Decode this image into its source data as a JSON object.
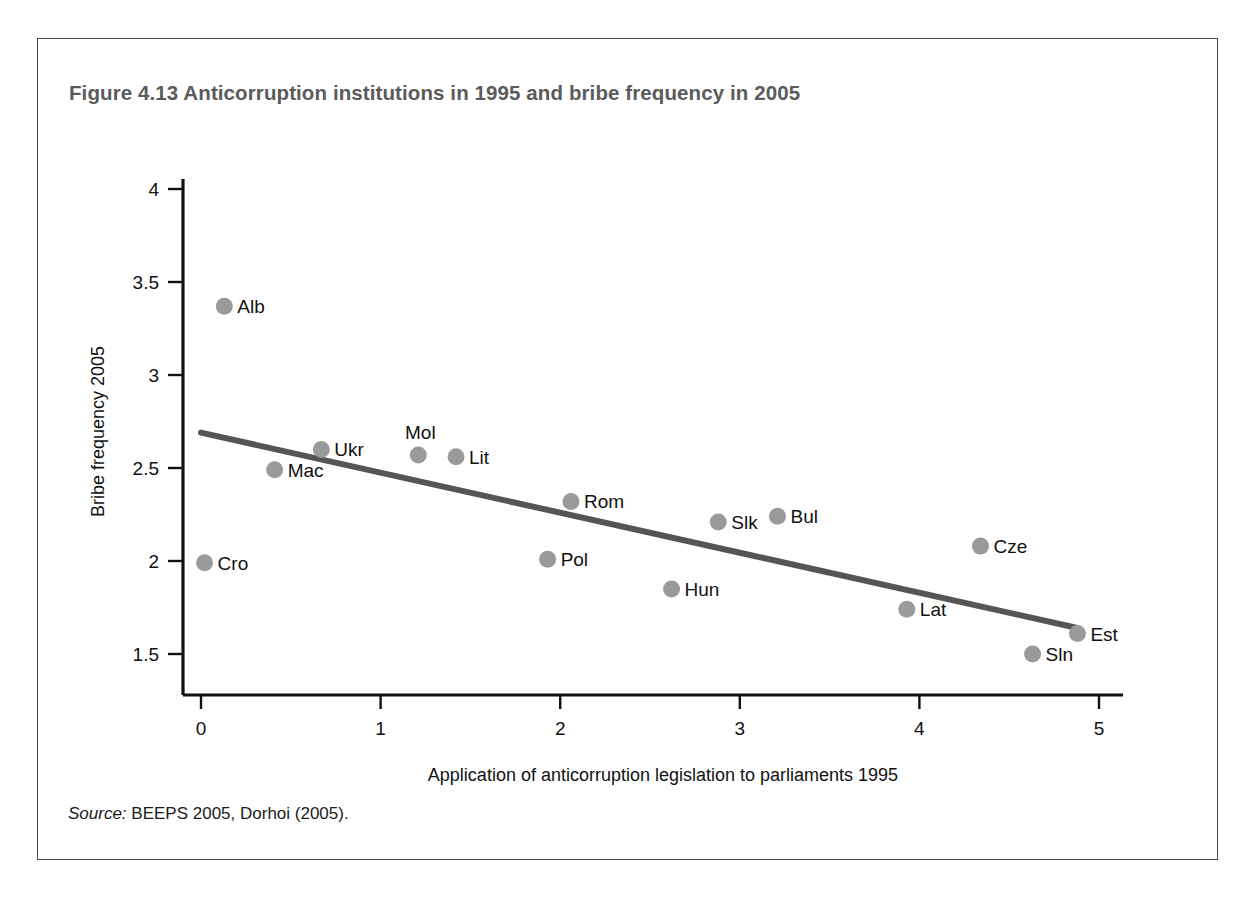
{
  "figure": {
    "title": "Figure 4.13  Anticorruption institutions in 1995 and bribe frequency in 2005",
    "source_label": "Source:",
    "source_text": " BEEPS 2005, Dorhoi (2005)."
  },
  "colors": {
    "frame_border": "#4a4a4a",
    "title_text": "#5b5b5b",
    "axis": "#111111",
    "marker": "#9a9a9a",
    "trend_line": "#555555",
    "background": "#ffffff"
  },
  "chart_data": {
    "type": "scatter",
    "title": "Figure 4.13  Anticorruption institutions in 1995 and bribe frequency in 2005",
    "xlabel": "Application of anticorruption legislation to parliaments 1995",
    "ylabel": "Bribe frequency 2005",
    "xlim": [
      0,
      5
    ],
    "ylim": [
      1.5,
      4
    ],
    "xticks": [
      0,
      1,
      2,
      3,
      4,
      5
    ],
    "xticklabels": [
      "0",
      "1",
      "2",
      "3",
      "4",
      "5"
    ],
    "yticks": [
      1.5,
      2,
      2.5,
      3,
      3.5,
      4
    ],
    "yticklabels": [
      "1.5",
      "2",
      "2.5",
      "3",
      "3.5",
      "4"
    ],
    "grid": false,
    "legend": "none",
    "points": [
      {
        "label": "Alb",
        "x": 0.13,
        "y": 3.37,
        "label_pos": "right"
      },
      {
        "label": "Mac",
        "x": 0.41,
        "y": 2.49,
        "label_pos": "right"
      },
      {
        "label": "Ukr",
        "x": 0.67,
        "y": 2.6,
        "label_pos": "right"
      },
      {
        "label": "Mol",
        "x": 1.21,
        "y": 2.57,
        "label_pos": "above"
      },
      {
        "label": "Lit",
        "x": 1.42,
        "y": 2.56,
        "label_pos": "right"
      },
      {
        "label": "Cro",
        "x": 0.02,
        "y": 1.99,
        "label_pos": "right"
      },
      {
        "label": "Pol",
        "x": 1.93,
        "y": 2.01,
        "label_pos": "right"
      },
      {
        "label": "Rom",
        "x": 2.06,
        "y": 2.32,
        "label_pos": "right"
      },
      {
        "label": "Hun",
        "x": 2.62,
        "y": 1.85,
        "label_pos": "right"
      },
      {
        "label": "Slk",
        "x": 2.88,
        "y": 2.21,
        "label_pos": "right"
      },
      {
        "label": "Bul",
        "x": 3.21,
        "y": 2.24,
        "label_pos": "right"
      },
      {
        "label": "Lat",
        "x": 3.93,
        "y": 1.74,
        "label_pos": "right"
      },
      {
        "label": "Cze",
        "x": 4.34,
        "y": 2.08,
        "label_pos": "right"
      },
      {
        "label": "Sln",
        "x": 4.63,
        "y": 1.5,
        "label_pos": "right"
      },
      {
        "label": "Est",
        "x": 4.88,
        "y": 1.61,
        "label_pos": "right"
      }
    ],
    "trend": {
      "x_start": 0.0,
      "y_start": 2.69,
      "x_end": 4.88,
      "y_end": 1.64
    }
  }
}
